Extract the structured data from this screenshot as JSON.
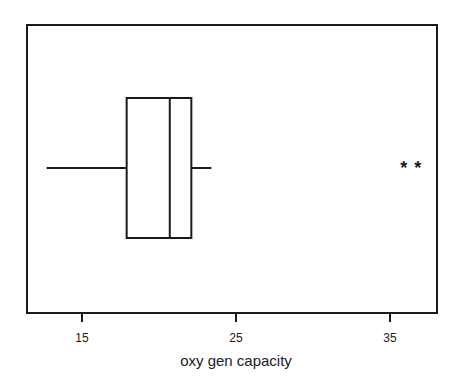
{
  "chart_data": {
    "type": "boxplot",
    "orientation": "horizontal",
    "title": "",
    "xlabel": "oxy gen capacity",
    "ylabel": "",
    "xlim": [
      12.7,
      38.1
    ],
    "xticks": [
      15,
      25,
      35
    ],
    "xtick_labels": [
      "15",
      "25",
      "35"
    ],
    "grid": false,
    "legend": null,
    "box": {
      "whisker_low": 12.7,
      "q1": 17.9,
      "median": 20.7,
      "q3": 22.1,
      "whisker_high": 23.4
    },
    "outliers": [
      35.9,
      36.8
    ],
    "outlier_marker": "*"
  },
  "colors": {
    "stroke": "#1a1a1a",
    "background": "#ffffff"
  }
}
